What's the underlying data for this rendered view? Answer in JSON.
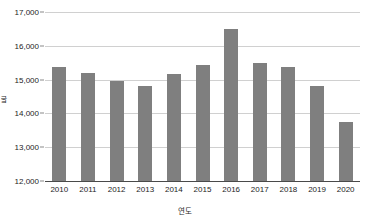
{
  "chart_data": {
    "type": "bar",
    "title": "",
    "xlabel": "연도",
    "ylabel": "톤",
    "categories": [
      "2010",
      "2011",
      "2012",
      "2013",
      "2014",
      "2015",
      "2016",
      "2017",
      "2018",
      "2019",
      "2020"
    ],
    "values": [
      15370,
      15200,
      14960,
      14800,
      15170,
      15430,
      16500,
      15480,
      15380,
      14800,
      13740
    ],
    "ylim": [
      12000,
      17000
    ],
    "ytick_labels": [
      "12,000",
      "13,000",
      "14,000",
      "15,000",
      "16,000",
      "17,000"
    ],
    "ytick_values": [
      12000,
      13000,
      14000,
      15000,
      16000,
      17000
    ],
    "grid": true,
    "legend": false,
    "bar_color": "#7f7f7f",
    "gridline_color": "#d0d0d0",
    "axis_color": "#4a4a4a",
    "background_color": "#ffffff"
  }
}
